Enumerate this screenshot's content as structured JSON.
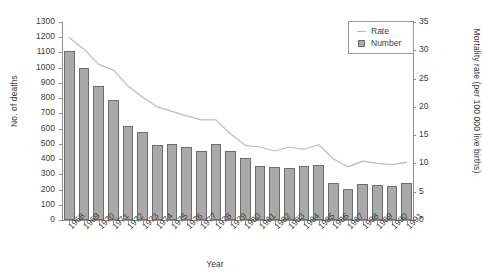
{
  "chart_data": {
    "type": "bar",
    "title": "",
    "xlabel": "Year",
    "ylabel": "No. of deaths",
    "ylabel_secondary": "Mortality rate (per 100 000 live births)",
    "categories": [
      "1968",
      "1969",
      "1970",
      "1971",
      "1972",
      "1973",
      "1974",
      "1975",
      "1976",
      "1977",
      "1978",
      "1979",
      "1980",
      "1981",
      "1982",
      "1983",
      "1984",
      "1985",
      "1986",
      "1987",
      "1988",
      "1989",
      "1990",
      "1991"
    ],
    "ylim": [
      0,
      1300
    ],
    "ylim_secondary": [
      0,
      35
    ],
    "yticks": [
      0,
      100,
      200,
      300,
      400,
      500,
      600,
      700,
      800,
      900,
      1000,
      1100,
      1200,
      1300
    ],
    "yticks_secondary": [
      0,
      5,
      10,
      15,
      20,
      25,
      30,
      35
    ],
    "grid": false,
    "legend_position": "top-right",
    "series": [
      {
        "name": "Number",
        "type": "bar",
        "axis": "left",
        "color": "#a9a9a9",
        "edge_color": "#6d6d6d",
        "values": [
          1110,
          995,
          880,
          785,
          615,
          575,
          490,
          500,
          480,
          455,
          500,
          450,
          410,
          355,
          350,
          340,
          355,
          360,
          240,
          205,
          235,
          230,
          225,
          240
        ]
      },
      {
        "name": "Rate",
        "type": "line",
        "axis": "right",
        "color": "#bcbcbc",
        "values": [
          32.2,
          30.2,
          27.5,
          26.5,
          23.7,
          21.7,
          20.0,
          19.2,
          18.4,
          17.7,
          17.7,
          15.2,
          13.2,
          12.9,
          12.2,
          12.9,
          12.5,
          13.3,
          10.8,
          9.4,
          10.4,
          10.0,
          9.8,
          10.2
        ]
      }
    ]
  },
  "legend": {
    "items": [
      {
        "label": "Rate",
        "key": "line-key"
      },
      {
        "label": "Number",
        "key": "square-key"
      }
    ]
  }
}
